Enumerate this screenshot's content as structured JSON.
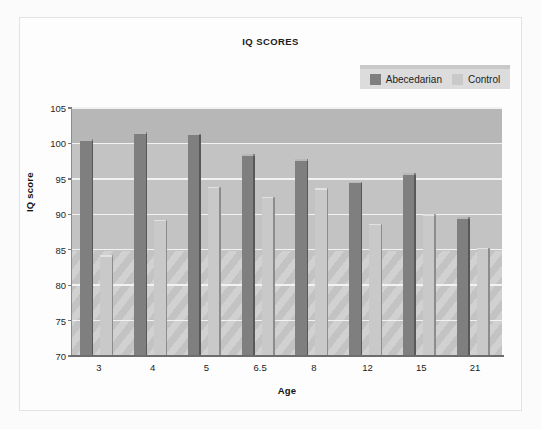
{
  "figure": {
    "title": "IQ SCORES",
    "background": "#fbfbfb",
    "plot_background": "#c3c3c3"
  },
  "legend": {
    "position": "top-right",
    "entries": [
      {
        "label": "Abecedarian",
        "color": "#7f7f7f"
      },
      {
        "label": "Control",
        "color": "#c9c9c9"
      }
    ]
  },
  "chart_data": {
    "type": "bar",
    "title": "IQ SCORES",
    "subtitle": "",
    "xlabel": "Age",
    "ylabel": "IQ score",
    "categories": [
      "3",
      "4",
      "5",
      "6.5",
      "8",
      "12",
      "15",
      "21"
    ],
    "series": [
      {
        "name": "Abecedarian",
        "color": "#7f7f7f",
        "values": [
          100.6,
          101.6,
          101.4,
          98.5,
          97.8,
          94.6,
          95.8,
          89.6
        ]
      },
      {
        "name": "Control",
        "color": "#c9c9c9",
        "values": [
          84.2,
          89.2,
          93.9,
          92.5,
          93.7,
          88.7,
          90.0,
          85.3
        ]
      }
    ],
    "ylim": [
      70,
      105
    ],
    "yticks": [
      70,
      75,
      80,
      85,
      90,
      95,
      100,
      105
    ],
    "ytick_labels": [
      "70",
      "75",
      "80",
      "85",
      "90",
      "95",
      "100",
      "105"
    ],
    "grid": true,
    "grid_color": "#f2f2f2",
    "legend_position": "top-right"
  }
}
